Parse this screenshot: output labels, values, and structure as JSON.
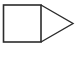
{
  "diagram": {
    "shapes": [
      {
        "type": "square",
        "name": "square-shape",
        "x": 3.5,
        "y": 5,
        "width": 37.5,
        "height": 37
      },
      {
        "type": "triangle",
        "name": "triangle-shape",
        "points": [
          [
            41,
            5
          ],
          [
            73,
            23.5
          ],
          [
            41,
            42
          ]
        ]
      }
    ],
    "stroke_color": "#2b2b2b",
    "fill_color": "#ffffff",
    "background": "#ffffff"
  }
}
